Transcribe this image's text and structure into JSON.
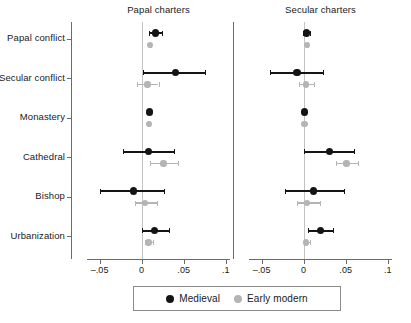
{
  "chart_data": {
    "type": "scatter",
    "subtype": "coefficient-plot-dot-and-whisker",
    "title": "",
    "panels": [
      {
        "label": "Papal charters",
        "xlabel": "",
        "xlim": [
          -0.065,
          0.105
        ],
        "xticks": [
          -0.05,
          0,
          0.05,
          0.1
        ],
        "xticklabels": [
          "–.05",
          "0",
          ".05",
          ".1"
        ],
        "zero_reference_line": 0
      },
      {
        "label": "Secular charters",
        "xlabel": "",
        "xlim": [
          -0.065,
          0.105
        ],
        "xticks": [
          -0.05,
          0,
          0.05,
          0.1
        ],
        "xticklabels": [
          "–.05",
          "0",
          ".05",
          ".1"
        ],
        "zero_reference_line": 0
      }
    ],
    "categories": [
      "Papal conflict",
      "Secular conflict",
      "Monastery",
      "Cathedral",
      "Bishop",
      "Urbanization"
    ],
    "ylabel": "",
    "grid": false,
    "legend_position": "bottom",
    "series": [
      {
        "name": "Medieval",
        "color": "#141414",
        "panels": [
          {
            "panel": "Papal charters",
            "points": [
              {
                "category": "Papal conflict",
                "estimate": 0.016,
                "ci_low": 0.009,
                "ci_high": 0.024
              },
              {
                "category": "Secular conflict",
                "estimate": 0.04,
                "ci_low": 0.002,
                "ci_high": 0.075
              },
              {
                "category": "Monastery",
                "estimate": 0.009,
                "ci_low": 0.007,
                "ci_high": 0.011
              },
              {
                "category": "Cathedral",
                "estimate": 0.008,
                "ci_low": -0.022,
                "ci_high": 0.039
              },
              {
                "category": "Bishop",
                "estimate": -0.01,
                "ci_low": -0.049,
                "ci_high": 0.026
              },
              {
                "category": "Urbanization",
                "estimate": 0.015,
                "ci_low": 0.0,
                "ci_high": 0.033
              }
            ]
          },
          {
            "panel": "Secular charters",
            "points": [
              {
                "category": "Papal conflict",
                "estimate": 0.003,
                "ci_low": -0.001,
                "ci_high": 0.008
              },
              {
                "category": "Secular conflict",
                "estimate": -0.008,
                "ci_low": -0.04,
                "ci_high": 0.023
              },
              {
                "category": "Monastery",
                "estimate": 0.001,
                "ci_low": 0.0,
                "ci_high": 0.002
              },
              {
                "category": "Cathedral",
                "estimate": 0.031,
                "ci_low": 0.0,
                "ci_high": 0.06
              },
              {
                "category": "Bishop",
                "estimate": 0.012,
                "ci_low": -0.022,
                "ci_high": 0.048
              },
              {
                "category": "Urbanization",
                "estimate": 0.02,
                "ci_low": 0.005,
                "ci_high": 0.035
              }
            ]
          }
        ]
      },
      {
        "name": "Early modern",
        "color": "#b4b4b4",
        "panels": [
          {
            "panel": "Papal charters",
            "points": [
              {
                "category": "Papal conflict",
                "estimate": 0.01,
                "ci_low": 0.009,
                "ci_high": 0.011
              },
              {
                "category": "Secular conflict",
                "estimate": 0.007,
                "ci_low": -0.006,
                "ci_high": 0.02
              },
              {
                "category": "Monastery",
                "estimate": 0.009,
                "ci_low": 0.008,
                "ci_high": 0.01
              },
              {
                "category": "Cathedral",
                "estimate": 0.026,
                "ci_low": 0.01,
                "ci_high": 0.043
              },
              {
                "category": "Bishop",
                "estimate": 0.004,
                "ci_low": -0.008,
                "ci_high": 0.018
              },
              {
                "category": "Urbanization",
                "estimate": 0.008,
                "ci_low": 0.004,
                "ci_high": 0.013
              }
            ]
          },
          {
            "panel": "Secular charters",
            "points": [
              {
                "category": "Papal conflict",
                "estimate": 0.004,
                "ci_low": 0.003,
                "ci_high": 0.005
              },
              {
                "category": "Secular conflict",
                "estimate": 0.003,
                "ci_low": -0.006,
                "ci_high": 0.012
              },
              {
                "category": "Monastery",
                "estimate": 0.001,
                "ci_low": 0.0,
                "ci_high": 0.002
              },
              {
                "category": "Cathedral",
                "estimate": 0.051,
                "ci_low": 0.038,
                "ci_high": 0.064
              },
              {
                "category": "Bishop",
                "estimate": 0.004,
                "ci_low": -0.008,
                "ci_high": 0.019
              },
              {
                "category": "Urbanization",
                "estimate": 0.003,
                "ci_low": 0.0,
                "ci_high": 0.007
              }
            ]
          }
        ]
      }
    ]
  },
  "legend": {
    "items": [
      {
        "label": "Medieval",
        "color": "#141414"
      },
      {
        "label": "Early modern",
        "color": "#b4b4b4"
      }
    ]
  }
}
